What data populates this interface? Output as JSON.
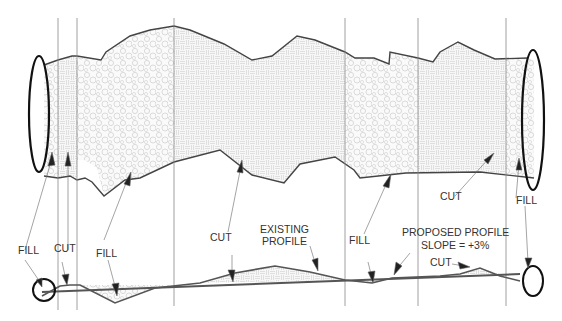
{
  "diagram": {
    "type": "cut-and-fill plan and profile",
    "labels": {
      "fill_1": "FILL",
      "cut_1": "CUT",
      "fill_2": "FILL",
      "cut_2": "CUT",
      "existing_profile_line1": "EXISTING",
      "existing_profile_line2": "PROFILE",
      "fill_3": "FILL",
      "proposed_profile_line1": "PROPOSED PROFILE",
      "proposed_profile_line2": "SLOPE = +3%",
      "cut_3": "CUT",
      "cut_4": "CUT",
      "fill_4": "FILL"
    },
    "zones": [
      "FILL",
      "CUT",
      "FILL",
      "CUT",
      "FILL",
      "CUT",
      "FILL"
    ],
    "colors": {
      "line": "#444444",
      "outline": "#111111",
      "hatch": "#bbbbbb"
    }
  }
}
